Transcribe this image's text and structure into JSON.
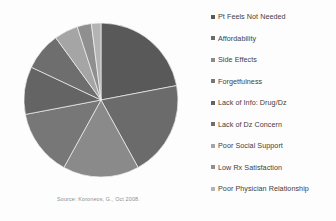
{
  "figure": {
    "background": "#fdfdfd",
    "source_note": "Source: Koroneos, G., Oct 2008."
  },
  "legend": {
    "position": "right",
    "marker_shape": "square",
    "items": [
      {
        "label": "Pt Feels Not Needed",
        "color": "#595959"
      },
      {
        "label": "Affordability",
        "color": "#6b6b6b"
      },
      {
        "label": "Side Effects",
        "color": "#8a8a8a"
      },
      {
        "label": "Forgetfulness",
        "color": "#777777"
      },
      {
        "label": "Lack of Info: Drug/Dz",
        "color": "#646464"
      },
      {
        "label": "Lack of Dz Concern",
        "color": "#6e6e6e"
      },
      {
        "label": "Poor Social Support",
        "color": "#a5a5a5"
      },
      {
        "label": "Low Rx Satisfaction",
        "color": "#8f8f8f"
      },
      {
        "label": "Poor Physician Relationship",
        "color": "#b4b4b4"
      }
    ]
  },
  "chart_data": {
    "type": "pie",
    "title": "",
    "subtitle": "",
    "xlabel": "",
    "ylabel": "",
    "grid": false,
    "legend_position": "right",
    "start_angle_deg": 0,
    "direction": "clockwise",
    "center_px": [
      77,
      78
    ],
    "radius_px": 77,
    "categories": [
      "Pt Feels Not Needed",
      "Affordability",
      "Side Effects",
      "Forgetfulness",
      "Lack of Info: Drug/Dz",
      "Lack of Dz Concern",
      "Poor Social Support",
      "Low Rx Satisfaction",
      "Poor Physician Relationship"
    ],
    "values": [
      22,
      20,
      16,
      14,
      10,
      8,
      5,
      3,
      2
    ],
    "unit": "percent",
    "colors": [
      "#595959",
      "#6b6b6b",
      "#8a8a8a",
      "#777777",
      "#646464",
      "#6e6e6e",
      "#a5a5a5",
      "#8f8f8f",
      "#b4b4b4"
    ],
    "annotations": [
      "Source: Koroneos, G., Oct 2008."
    ]
  }
}
